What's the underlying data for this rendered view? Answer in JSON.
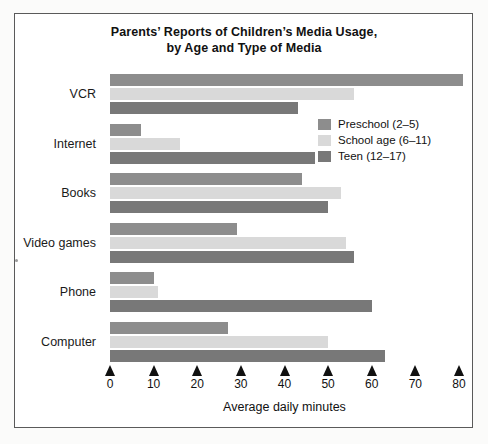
{
  "figure": {
    "title_line1": "Parents’ Reports of Children’s Media Usage,",
    "title_line2": "by Age and Type of Media"
  },
  "colors": {
    "preschool": "#8d8d8d",
    "school_age": "#d9d9d9",
    "teen": "#787878",
    "frame": "#5a5a5a",
    "text": "#111111",
    "background": "#ffffff"
  },
  "legend": {
    "position": "inside-upper-right",
    "entries": [
      {
        "label": "Preschool (2–5)",
        "color": "#8d8d8d"
      },
      {
        "label": "School age (6–11)",
        "color": "#d9d9d9"
      },
      {
        "label": "Teen (12–17)",
        "color": "#787878"
      }
    ]
  },
  "axis": {
    "x_ticks": [
      "0",
      "10",
      "20",
      "30",
      "40",
      "50",
      "60",
      "70",
      "80"
    ],
    "x_title": "Average daily minutes"
  },
  "chart_data": {
    "type": "bar",
    "orientation": "horizontal",
    "title": "Parents’ Reports of Children’s Media Usage, by Age and Type of Media",
    "xlabel": "Average daily minutes",
    "ylabel": "",
    "xlim": [
      0,
      80
    ],
    "xticks": [
      0,
      10,
      20,
      30,
      40,
      50,
      60,
      70,
      80
    ],
    "grid": false,
    "legend_position": "upper right (inside plot)",
    "categories": [
      "VCR",
      "Internet",
      "Books",
      "Video games",
      "Phone",
      "Computer"
    ],
    "series": [
      {
        "name": "Preschool (2–5)",
        "color": "#8d8d8d",
        "values": [
          81,
          7,
          44,
          29,
          10,
          27
        ]
      },
      {
        "name": "School age (6–11)",
        "color": "#d9d9d9",
        "values": [
          56,
          16,
          53,
          54,
          11,
          50
        ]
      },
      {
        "name": "Teen (12–17)",
        "color": "#787878",
        "values": [
          43,
          47,
          50,
          56,
          60,
          63
        ]
      }
    ]
  }
}
